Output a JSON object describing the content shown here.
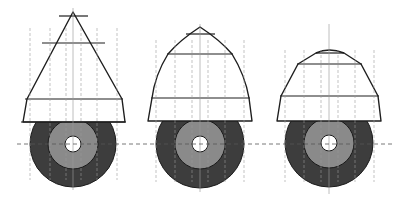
{
  "diagram": {
    "colors": {
      "background": "#ffffff",
      "outline": "#1e1e1e",
      "outer_ring": "#3d3d3d",
      "middle_ring": "#8a8a8a",
      "hole": "#ffffff",
      "construction_line": "#9a9a9a",
      "center_line": "#555555"
    },
    "center_line_y": 144,
    "center_line_x_range": [
      17,
      392
    ],
    "figures": [
      {
        "name": "cone-straight",
        "cx": 73,
        "cy": 144,
        "outer_r": 43,
        "middle_r": 25,
        "inner_r": 8,
        "profile": "M73,12 L27,99 L23,122 L125,122 L122,99 Z",
        "profile_curve": "straight",
        "h_lines": [
          {
            "y": 16,
            "x1": 59,
            "x2": 88
          },
          {
            "y": 43,
            "x1": 42,
            "x2": 105
          },
          {
            "y": 99,
            "x1": 25,
            "x2": 123
          },
          {
            "y": 122,
            "x1": 21,
            "x2": 126
          }
        ],
        "v_dashes": [
          30,
          50,
          66,
          81,
          97,
          117
        ],
        "v_dash_range": [
          28,
          180
        ],
        "axis_range": [
          8,
          190
        ]
      },
      {
        "name": "cone-bell",
        "cx": 200,
        "cy": 144,
        "outer_r": 44,
        "middle_r": 25,
        "inner_r": 8,
        "profile": "M200,27 Q180,40 168,54 Q155,75 152,98 L148,121 L252,121 L249,98 Q245,75 232,54 Q220,40 200,27 Z",
        "profile_curve": "bell",
        "h_lines": [
          {
            "y": 34,
            "x1": 186,
            "x2": 215
          },
          {
            "y": 54,
            "x1": 167,
            "x2": 233
          },
          {
            "y": 98,
            "x1": 151,
            "x2": 250
          }
        ],
        "v_dashes": [
          156,
          175,
          192,
          208,
          225,
          244
        ],
        "v_dash_range": [
          40,
          182
        ],
        "axis_range": [
          24,
          192
        ]
      },
      {
        "name": "cone-truncated",
        "cx": 329,
        "cy": 143,
        "outer_r": 44,
        "middle_r": 25,
        "inner_r": 8,
        "profile": "M316,53 Q329,47 344,53 L361,64 L378,96 L381,121 L277,121 L281,96 L298,64 Z",
        "profile_curve": "truncated-ogive",
        "h_lines": [
          {
            "y": 53,
            "x1": 316,
            "x2": 344
          },
          {
            "y": 64,
            "x1": 297,
            "x2": 362
          },
          {
            "y": 96,
            "x1": 280,
            "x2": 379
          }
        ],
        "v_dashes": [
          285,
          304,
          321,
          338,
          355,
          374
        ],
        "v_dash_range": [
          50,
          182
        ],
        "axis_range": [
          24,
          194
        ]
      }
    ]
  }
}
